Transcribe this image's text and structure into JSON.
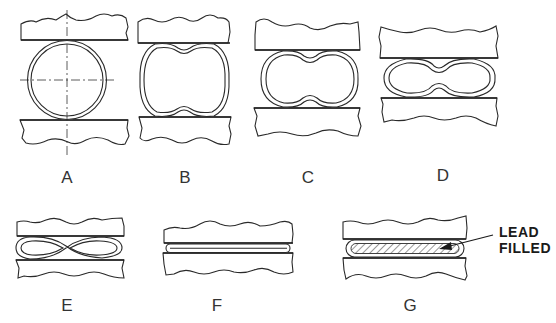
{
  "figure": {
    "stages": [
      {
        "id": "A",
        "label": "A",
        "shape": "round tube with centerlines"
      },
      {
        "id": "B",
        "label": "B",
        "shape": "slightly dented tube"
      },
      {
        "id": "C",
        "label": "C",
        "shape": "dented oval tube"
      },
      {
        "id": "D",
        "label": "D",
        "shape": "peanut-shaped flattened tube"
      },
      {
        "id": "E",
        "label": "E",
        "shape": "figure-eight collapsed tube"
      },
      {
        "id": "F",
        "label": "F",
        "shape": "fully flattened tube"
      },
      {
        "id": "G",
        "label": "G",
        "shape": "flattened tube with hatched lead fill"
      }
    ],
    "callout": {
      "line1": "LEAD",
      "line2": "FILLED",
      "target_stage": "G"
    }
  }
}
